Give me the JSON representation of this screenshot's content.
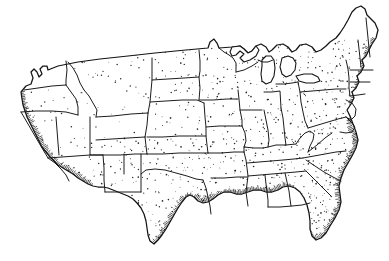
{
  "figure": {
    "kind": "map",
    "style": "pen-and-ink stipple engraving",
    "projection_note": "contiguous 48 states, no labels shown",
    "width": 389,
    "height": 261,
    "has_text_labels": false,
    "has_legend": false,
    "has_border_frame": false
  },
  "colors": {
    "background": "#ffffff",
    "state_border": "#1d1d1d",
    "national_outline": "#141414",
    "stipple": "#2a2a2a",
    "coast_shading": "#1a1a1a"
  },
  "regions": [
    {
      "id": "pacific-northwest",
      "members": "WA, OR, ID",
      "shading": "light"
    },
    {
      "id": "california-coast",
      "members": "CA",
      "shading": "heavy coastal stipple"
    },
    {
      "id": "mountain-west",
      "members": "NV, UT, AZ, CO, WY, MT, NM",
      "shading": "light"
    },
    {
      "id": "great-plains",
      "members": "ND, SD, NE, KS, OK, TX",
      "shading": "light to medium"
    },
    {
      "id": "midwest",
      "members": "MN, IA, MO, WI, IL, IN, MI, OH",
      "shading": "medium"
    },
    {
      "id": "south",
      "members": "AR, LA, MS, AL, TN, KY, GA, FL, SC, NC",
      "shading": "heavy"
    },
    {
      "id": "mid-atlantic",
      "members": "VA, WV, MD, DE, PA, NJ, NY",
      "shading": "heavy"
    },
    {
      "id": "new-england",
      "members": "ME, NH, VT, MA, CT, RI",
      "shading": "medium to heavy"
    }
  ],
  "features": {
    "great_lakes": "white unshaded cutouts north of Michigan, Wisconsin, Ohio",
    "florida_peninsula": "elongated southeast peninsula with dense edge stipple",
    "texas_panhandle": "visible notch at north of Texas",
    "puget_sound": "notched northwest corner of Washington",
    "cape_cod": "small hook on Massachusetts coast",
    "maine": "tall narrow block at far northeast"
  },
  "stipple": {
    "seed": 20240607,
    "total_dots": 1500,
    "dot_radius_min": 0.38,
    "dot_radius_max": 0.85,
    "description": "density increases from west to east and toward coastlines"
  }
}
